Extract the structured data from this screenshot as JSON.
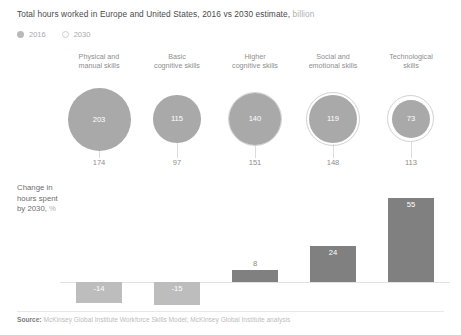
{
  "header": {
    "title_main": "Total hours worked in Europe and United States, 2016 vs 2030 estimate,",
    "title_unit": "billion"
  },
  "legend": {
    "items": [
      {
        "label": "2016",
        "marker": "filled-circle"
      },
      {
        "label": "2030",
        "marker": "open-circle"
      }
    ]
  },
  "change_block": {
    "line1": "Change in",
    "line2": "hours spent",
    "line3": "by 2030,",
    "unit": "%"
  },
  "footer": {
    "source_label": "Source:",
    "source_text": "McKinsey Global Institute Workforce Skills Model; McKinsey Global Institute analysis"
  },
  "colors": {
    "bubble_2016": "#a9a9a9",
    "bubble_2030_ring": "#d2d2d2",
    "bar_positive": "#808080",
    "bar_negative": "#bdbdbd",
    "zero_line": "#e2e2e2",
    "text_muted": "#8e8e8e"
  },
  "chart_data": {
    "type": "bar",
    "title": "Total hours worked in Europe and United States, 2016 vs 2030 estimate, billion",
    "categories": [
      "Physical and manual skills",
      "Basic cognitive skills",
      "Higher cognitive skills",
      "Social and emotional skills",
      "Technological skills"
    ],
    "category_lines": [
      [
        "Physical and",
        "manual skills"
      ],
      [
        "Basic",
        "cognitive skills"
      ],
      [
        "Higher",
        "cognitive skills"
      ],
      [
        "Social and",
        "emotional skills"
      ],
      [
        "Technological",
        "skills"
      ]
    ],
    "series": [
      {
        "name": "2016",
        "unit": "billion hours",
        "values": [
          203,
          115,
          140,
          119,
          73
        ]
      },
      {
        "name": "2030",
        "unit": "billion hours",
        "values": [
          174,
          97,
          151,
          148,
          113
        ]
      },
      {
        "name": "Change in hours spent by 2030",
        "unit": "%",
        "values": [
          -14,
          -15,
          8,
          24,
          55
        ]
      }
    ],
    "bubble_2016_labels": [
      "203",
      "115",
      "140",
      "119",
      "73"
    ],
    "bubble_2030_labels": [
      "174",
      "97",
      "151",
      "148",
      "113"
    ],
    "change_labels": [
      "-14",
      "-15",
      "8",
      "24",
      "55"
    ],
    "xlabel": "",
    "ylabel": "",
    "grid": false,
    "legend_position": "top-left"
  }
}
